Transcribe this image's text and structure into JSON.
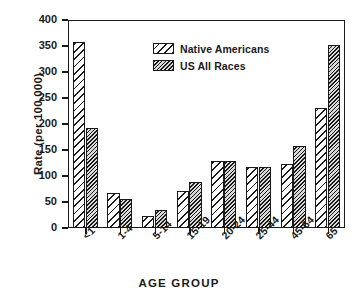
{
  "chart_data": {
    "type": "bar",
    "title": "",
    "xlabel": "AGE GROUP",
    "ylabel": "Rate (per 100,000)",
    "categories": [
      "<1",
      "1-4",
      "5-14",
      "15-19",
      "20-24",
      "25-44",
      "45-64",
      "65"
    ],
    "series": [
      {
        "name": "Native Americans",
        "pattern": "diagonal-hatch-wide",
        "fill": "#ffffff",
        "values": [
          358,
          67,
          23,
          71,
          128,
          118,
          123,
          230
        ]
      },
      {
        "name": "US All Races",
        "pattern": "diagonal-hatch-dense",
        "fill": "#d9d9d9",
        "values": [
          192,
          55,
          34,
          88,
          128,
          118,
          157,
          352
        ]
      }
    ],
    "ylim": [
      0,
      400
    ],
    "yticks": [
      0,
      50,
      100,
      150,
      200,
      250,
      300,
      350,
      400
    ],
    "ytick_labels": [
      "0",
      "50",
      "100",
      "150",
      "200",
      "250",
      "300",
      "350",
      "400"
    ],
    "grid": false,
    "legend_position": "upper-center",
    "axis_color": "#1a1a1a",
    "background": "#ffffff"
  }
}
